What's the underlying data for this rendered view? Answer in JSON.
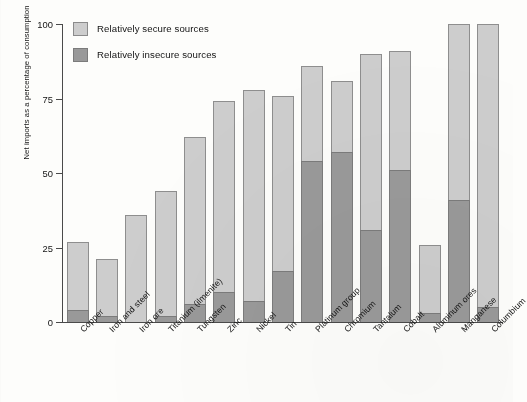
{
  "chart_data": {
    "type": "bar",
    "subtype": "stacked-vertical",
    "title": "",
    "xlabel": "",
    "ylabel": "Net imports as a percentage of consumption",
    "ylim": [
      0,
      100
    ],
    "yticks": [
      0,
      25,
      50,
      75,
      100
    ],
    "ytick_labels": [
      "0",
      "25",
      "50",
      "75",
      "100"
    ],
    "grid": false,
    "legend_position": "top-left",
    "categories": [
      "Copper",
      "Iron and steel",
      "Iron ore",
      "Titanium (ilmenite)",
      "Tungsten",
      "Zinc",
      "Nickel",
      "Tin",
      "Platinum group",
      "Chromium",
      "Tantalum",
      "Cobalt",
      "Aluminum ores",
      "Manganese",
      "Columbium"
    ],
    "series": [
      {
        "name": "Relatively insecure sources",
        "color": "#999999",
        "values": [
          4,
          2,
          0,
          2,
          6,
          10,
          7,
          17,
          54,
          57,
          31,
          51,
          3,
          41,
          5
        ]
      },
      {
        "name": "Relatively secure sources",
        "color": "#cdcdcd",
        "values": [
          23,
          19,
          36,
          42,
          56,
          64,
          71,
          59,
          32,
          24,
          59,
          40,
          23,
          59,
          95
        ]
      }
    ],
    "totals": [
      27,
      21,
      36,
      44,
      62,
      74,
      78,
      76,
      86,
      81,
      90,
      91,
      26,
      100,
      100
    ]
  },
  "legend": {
    "items": [
      {
        "label": "Relatively secure sources",
        "swatch": "secure"
      },
      {
        "label": "Relatively insecure sources",
        "swatch": "insecure"
      }
    ]
  }
}
